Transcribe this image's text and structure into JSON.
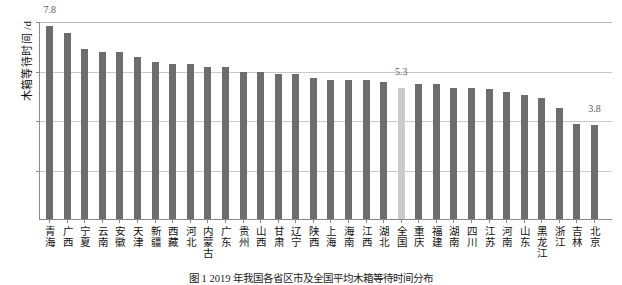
{
  "chart_data": {
    "type": "bar",
    "title": "",
    "xlabel": "",
    "ylabel": "木箱等待时间 /d",
    "ylim": [
      0,
      8
    ],
    "yticks": [
      2,
      4,
      6,
      8
    ],
    "grid": true,
    "legend": "none",
    "categories": [
      "青海",
      "广西",
      "宁夏",
      "云南",
      "安徽",
      "天津",
      "新疆",
      "西藏",
      "河北",
      "内蒙古",
      "广东",
      "贵州",
      "山西",
      "甘肃",
      "辽宁",
      "陕西",
      "上海",
      "海南",
      "江西",
      "湖北",
      "全国",
      "重庆",
      "福建",
      "湖南",
      "四川",
      "江苏",
      "河南",
      "山东",
      "黑龙江",
      "浙江",
      "吉林",
      "北京"
    ],
    "values": [
      7.8,
      7.5,
      6.85,
      6.75,
      6.75,
      6.55,
      6.35,
      6.25,
      6.25,
      6.15,
      6.15,
      5.95,
      5.95,
      5.85,
      5.85,
      5.7,
      5.6,
      5.6,
      5.6,
      5.55,
      5.3,
      5.45,
      5.45,
      5.3,
      5.3,
      5.25,
      5.15,
      5.0,
      4.9,
      4.5,
      3.85,
      3.8
    ],
    "highlight_index": 20,
    "highlight_label": "全国",
    "data_labels": [
      {
        "index": 0,
        "text": "7.8"
      },
      {
        "index": 20,
        "text": "5.3"
      },
      {
        "index": 31,
        "text": "3.8"
      }
    ],
    "colors": {
      "bar": "#6d6d6d",
      "bar_highlight": "#cbcbcb",
      "grid": "#c9c9c9",
      "axis": "#8a8a8a",
      "text": "#111111",
      "label_text": "#5a5a5a"
    }
  },
  "caption": "图 1   2019 年我国各省区市及全国平均木箱等待时间分布"
}
